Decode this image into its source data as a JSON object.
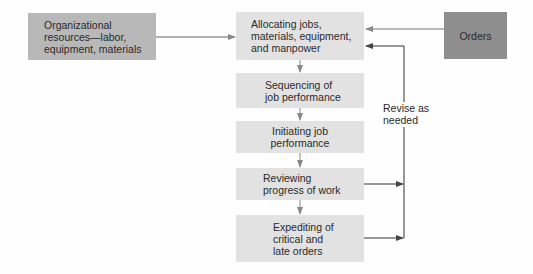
{
  "diagram": {
    "resources": {
      "label": "Organizational\nresources—labor,\nequipment, materials"
    },
    "orders": {
      "label": "Orders"
    },
    "steps": [
      {
        "label": "Allocating jobs,\nmaterials, equipment,\nand manpower"
      },
      {
        "label": "Sequencing of\njob performance"
      },
      {
        "label": "Initiating job\nperformance"
      },
      {
        "label": "Reviewing\nprogress of work"
      },
      {
        "label": "Expediting of\ncritical and\nlate orders"
      }
    ],
    "feedback": {
      "label": "Revise as\nneeded"
    }
  },
  "colors": {
    "step_fill": "#e2e2e2",
    "resources_fill": "#b8b8b8",
    "orders_fill": "#8e8e8e",
    "line": "#555555"
  }
}
